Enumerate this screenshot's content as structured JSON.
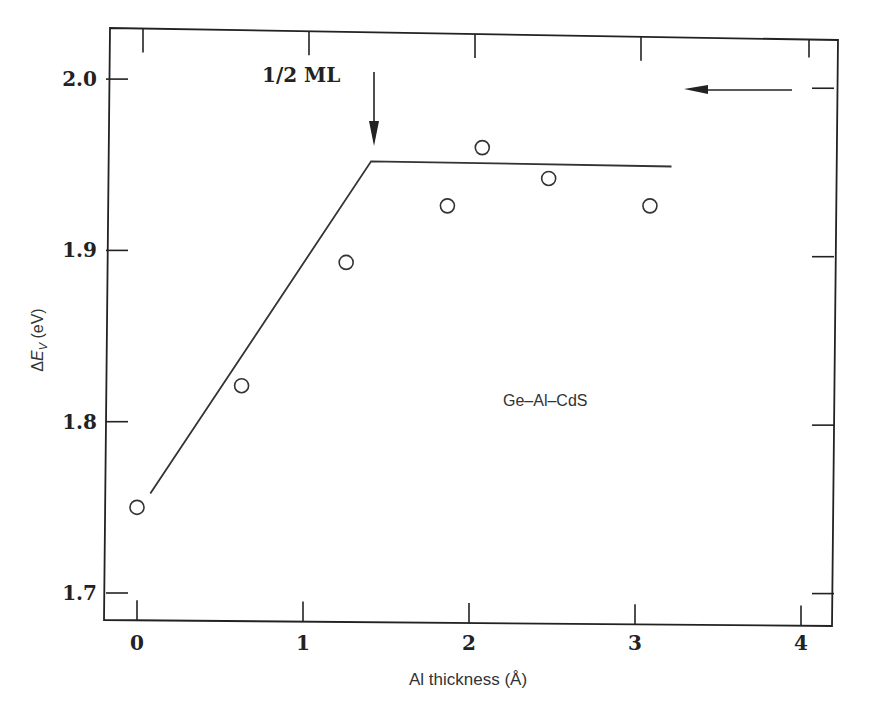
{
  "chart_data": {
    "type": "scatter",
    "title": "",
    "xlabel": "Al thickness (Å)",
    "ylabel": "ΔE_V (eV)",
    "ylabel_parts": {
      "delta": "Δ",
      "E": "E",
      "sub": "V",
      "unit": " (eV)"
    },
    "xlim": [
      -0.2,
      4.2
    ],
    "ylim": [
      1.685,
      2.035
    ],
    "x_ticks": [
      0,
      1,
      2,
      3,
      4
    ],
    "x_tick_labels": [
      "0",
      "1",
      "2",
      "3",
      "4"
    ],
    "y_ticks": [
      1.7,
      1.8,
      1.9,
      2.0
    ],
    "y_tick_labels": [
      "1.7",
      "1.8",
      "1.9",
      "2.0"
    ],
    "grid": false,
    "legend": null,
    "series": [
      {
        "name": "Ge-Al-CdS data",
        "type": "scatter",
        "marker": "open-circle",
        "x": [
          0.0,
          0.63,
          1.26,
          1.87,
          2.08,
          2.48,
          3.09
        ],
        "y": [
          1.75,
          1.821,
          1.893,
          1.926,
          1.96,
          1.942,
          1.926
        ]
      },
      {
        "name": "fit line",
        "type": "line",
        "x": [
          0.08,
          1.41,
          3.22
        ],
        "y": [
          1.758,
          1.952,
          1.949
        ]
      }
    ],
    "annotations": [
      {
        "text": "1/2 ML",
        "type": "arrow-down",
        "x": 1.45,
        "y_from": 2.006,
        "y_to": 1.962
      },
      {
        "text": "Ge–Al–CdS",
        "type": "label",
        "x": 2.6,
        "y": 1.81
      },
      {
        "text": "",
        "type": "arrow-left",
        "x_from": 3.97,
        "x_to": 3.32,
        "y": 1.995
      }
    ]
  }
}
